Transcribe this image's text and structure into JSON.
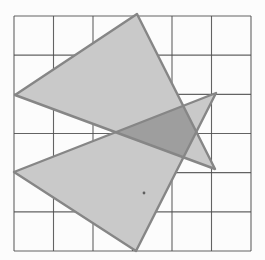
{
  "figure": {
    "background": "#fcfcfc",
    "grid": {
      "x0": 14,
      "y0": 16,
      "x1": 251,
      "y1": 251,
      "cols": 6,
      "rows": 6,
      "line_color": "#4d4d4d",
      "line_width": 1.1
    },
    "triangle_fill": "#c9c9c9",
    "triangle_stroke": "#868686",
    "triangle_stroke_width": 2.4,
    "overlap_fill": "#9e9e9e",
    "triangles": [
      {
        "name": "upper-triangle",
        "points": [
          [
            15,
            95
          ],
          [
            137,
            14
          ],
          [
            215,
            169
          ]
        ]
      },
      {
        "name": "lower-triangle",
        "points": [
          [
            14,
            172
          ],
          [
            216,
            93
          ],
          [
            136,
            251
          ]
        ]
      }
    ],
    "overlap_points": [
      [
        115.7,
        132.2
      ],
      [
        183.2,
        105.8
      ],
      [
        196.3,
        131.9
      ],
      [
        183.4,
        157.3
      ]
    ],
    "speck": {
      "x": 144,
      "y": 193,
      "r": 1.4,
      "color": "#5f5f5f"
    }
  }
}
